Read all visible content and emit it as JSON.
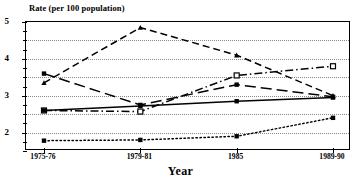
{
  "chart_data": {
    "type": "line",
    "title": "",
    "ylabel": "Rate (per 100 population)",
    "xlabel": "Year",
    "categories": [
      "1975-76",
      "1979-81",
      "1985",
      "1989-90"
    ],
    "ylim": [
      1.5,
      5
    ],
    "yticks_major": [
      2,
      3,
      4,
      5
    ],
    "ytick_labels": [
      "2",
      "3",
      "4",
      "5"
    ],
    "gridlines": [
      2.0,
      2.5,
      3.0,
      3.5,
      4.0,
      4.5
    ],
    "grid": true,
    "legend": "none",
    "series": [
      {
        "name": "series-1",
        "style": "dashed",
        "marker": "triangle",
        "values": [
          3.35,
          4.85,
          4.1,
          3.0
        ]
      },
      {
        "name": "series-2",
        "style": "long-dash",
        "marker": "square-filled",
        "values": [
          3.6,
          2.75,
          3.3,
          2.97
        ]
      },
      {
        "name": "series-3",
        "style": "dash-dot",
        "marker": "square-open",
        "values": [
          2.6,
          2.57,
          3.55,
          3.8
        ]
      },
      {
        "name": "series-4",
        "style": "solid",
        "marker": "square-filled",
        "values": [
          2.6,
          2.72,
          2.85,
          2.95
        ]
      },
      {
        "name": "series-5",
        "style": "dotted",
        "marker": "square-filled",
        "values": [
          1.78,
          1.8,
          1.9,
          2.4
        ]
      }
    ]
  },
  "colors": {
    "ink": "#000000",
    "grid": "#8a8a8a",
    "background": "#ffffff"
  }
}
